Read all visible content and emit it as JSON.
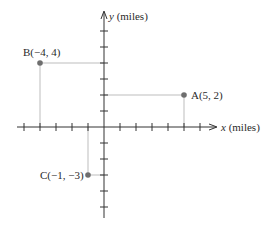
{
  "diagram": {
    "type": "coordinate-plane",
    "x_axis_label_var": "x",
    "x_axis_label_unit": " (miles)",
    "y_axis_label_var": "y",
    "y_axis_label_unit": " (miles)",
    "x_range": [
      -5,
      6
    ],
    "y_range": [
      -6,
      6
    ],
    "tick_step": 1,
    "points": [
      {
        "name": "A",
        "x": 5,
        "y": 2,
        "label": "A(5, 2)"
      },
      {
        "name": "B",
        "x": -4,
        "y": 4,
        "label": "B(−4, 4)"
      },
      {
        "name": "C",
        "x": -1,
        "y": -3,
        "label": "C(−1, −3)"
      }
    ],
    "colors": {
      "axis": "#333333",
      "guide": "#bdbdbd",
      "point": "#6e6e6e",
      "text": "#2a2a2a"
    }
  }
}
